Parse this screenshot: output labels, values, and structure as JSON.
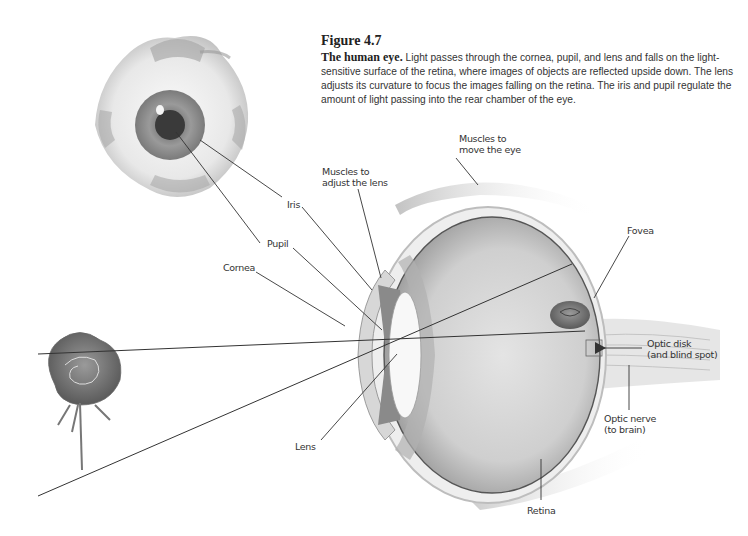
{
  "figure": {
    "number": "Figure 4.7",
    "title": "The human eye.",
    "caption": "Light passes through the cornea, pupil, and lens and falls on the light-sensitive surface of the retina, where images of objects are reflected upside down. The lens adjusts its curvature to focus the images falling on the retina. The iris and pupil regulate the amount of light passing into the rear chamber of the eye."
  },
  "labels": {
    "muscles_move": [
      "Muscles to",
      "move the eye"
    ],
    "muscles_lens": [
      "Muscles to",
      "adjust the lens"
    ],
    "iris": "Iris",
    "pupil": "Pupil",
    "cornea": "Cornea",
    "fovea": "Fovea",
    "optic_disk": [
      "Optic disk",
      "(and blind spot)"
    ],
    "optic_nerve": [
      "Optic nerve",
      "(to brain)"
    ],
    "lens": "Lens",
    "retina": "Retina"
  },
  "colors": {
    "line": "#333333",
    "text": "#333333",
    "sclera": "#e6e6e6",
    "iris": "#8a8a8a",
    "pupil": "#3a3a3a"
  }
}
